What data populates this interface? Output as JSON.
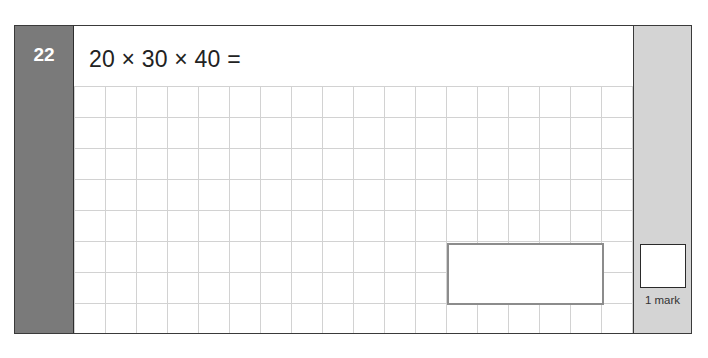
{
  "question": {
    "number": "22",
    "text": "20 × 30 × 40 ="
  },
  "answer_box": {
    "value": ""
  },
  "marks": {
    "label": "1 mark",
    "value": ""
  },
  "colors": {
    "number_column": "#7a7a7a",
    "mark_column": "#d4d4d4",
    "grid_lines": "#d2d2d2",
    "answer_border": "#8c8c8c"
  }
}
